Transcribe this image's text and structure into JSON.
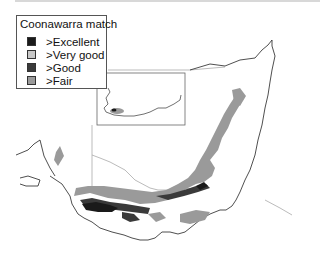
{
  "legend": {
    "title": "Coonawarra match",
    "items": [
      {
        "label": ">Excellent",
        "color": "#1a1a1a"
      },
      {
        "label": ">Very good",
        "color": "#c8c8c8"
      },
      {
        "label": ">Good",
        "color": "#3a3a3a"
      },
      {
        "label": ">Fair",
        "color": "#9a9a9a"
      }
    ]
  },
  "colors": {
    "coastline": "#222222",
    "state_border": "#aaaaaa",
    "inset_frame": "#666666",
    "background": "#ffffff"
  }
}
